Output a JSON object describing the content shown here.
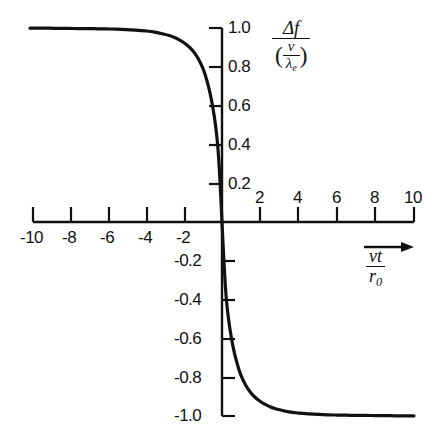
{
  "figure": {
    "background_color": "#ffffff",
    "ink_color": "#111111"
  },
  "axis_titles": {
    "y": {
      "numerator": "Δf",
      "denominator_open_paren": "(",
      "denominator_numerator": "v",
      "denominator_denominator_symbol": "λ",
      "denominator_denominator_sub": "e",
      "denominator_close_paren": ")",
      "plain": "Δf / (v/λₑ)"
    },
    "x": {
      "numerator": "vt",
      "denominator_symbol": "r",
      "denominator_sub": "0",
      "arrow": "→",
      "plain": "vt / r₀"
    }
  },
  "chart_data": {
    "type": "line",
    "title": "",
    "xlabel": "vt / r₀",
    "ylabel": "Δf / (v/λₑ)",
    "xlim": [
      -10,
      10
    ],
    "ylim": [
      -1.0,
      1.0
    ],
    "grid": false,
    "legend": null,
    "xticks": [
      -10,
      -8,
      -6,
      -4,
      -2,
      2,
      4,
      6,
      8,
      10
    ],
    "xtick_labels": [
      "-10",
      "-8",
      "-6",
      "-4",
      "-2",
      "2",
      "4",
      "6",
      "8",
      "10"
    ],
    "xticks_negative": [
      -10,
      -8,
      -6,
      -4,
      -2
    ],
    "xtick_labels_negative": [
      "-10",
      "-8",
      "-6",
      "-4",
      "-2"
    ],
    "xticks_positive": [
      2,
      4,
      6,
      8,
      10
    ],
    "xtick_labels_positive": [
      "2",
      "4",
      "6",
      "8",
      "10"
    ],
    "yticks": [
      1.0,
      0.8,
      0.6,
      0.4,
      0.2,
      -0.2,
      -0.4,
      -0.6,
      -0.8,
      -1.0
    ],
    "ytick_labels_positive": [
      "1.0",
      "0.8",
      "0.6",
      "0.4",
      "0.2"
    ],
    "yticks_positive": [
      1.0,
      0.8,
      0.6,
      0.4,
      0.2
    ],
    "ytick_labels_negative": [
      "-0.2",
      "-0.4",
      "-0.6",
      "-0.8",
      "-1.0"
    ],
    "yticks_negative": [
      -0.2,
      -0.4,
      -0.6,
      -0.8,
      -1.0
    ],
    "series": [
      {
        "name": "Doppler frequency shift",
        "color": "#111111",
        "line_width": 3.2,
        "x": [
          -10,
          -9.5,
          -9,
          -8.5,
          -8,
          -7.5,
          -7,
          -6.5,
          -6,
          -5.5,
          -5,
          -4.5,
          -4,
          -3.5,
          -3,
          -2.75,
          -2.5,
          -2.25,
          -2,
          -1.75,
          -1.5,
          -1.25,
          -1,
          -0.85,
          -0.7,
          -0.6,
          -0.5,
          -0.4,
          -0.3,
          -0.22,
          -0.15,
          -0.1,
          -0.05,
          0,
          0.05,
          0.1,
          0.15,
          0.22,
          0.3,
          0.4,
          0.5,
          0.6,
          0.7,
          0.85,
          1,
          1.25,
          1.5,
          1.75,
          2,
          2.25,
          2.5,
          2.75,
          3,
          3.5,
          4,
          4.5,
          5,
          5.5,
          6,
          6.5,
          7,
          7.5,
          8,
          8.5,
          9,
          9.5,
          10
        ],
        "y": [
          0.999,
          0.999,
          0.999,
          0.998,
          0.998,
          0.997,
          0.997,
          0.996,
          0.995,
          0.994,
          0.992,
          0.989,
          0.985,
          0.979,
          0.968,
          0.961,
          0.952,
          0.94,
          0.925,
          0.906,
          0.88,
          0.844,
          0.793,
          0.75,
          0.697,
          0.654,
          0.603,
          0.542,
          0.468,
          0.39,
          0.291,
          0.2,
          0.103,
          0,
          -0.103,
          -0.2,
          -0.291,
          -0.39,
          -0.468,
          -0.542,
          -0.603,
          -0.654,
          -0.697,
          -0.75,
          -0.793,
          -0.844,
          -0.88,
          -0.906,
          -0.925,
          -0.94,
          -0.952,
          -0.961,
          -0.968,
          -0.979,
          -0.985,
          -0.989,
          -0.992,
          -0.994,
          -0.995,
          -0.996,
          -0.997,
          -0.997,
          -0.998,
          -0.998,
          -0.999,
          -0.999,
          -0.999
        ]
      }
    ]
  }
}
